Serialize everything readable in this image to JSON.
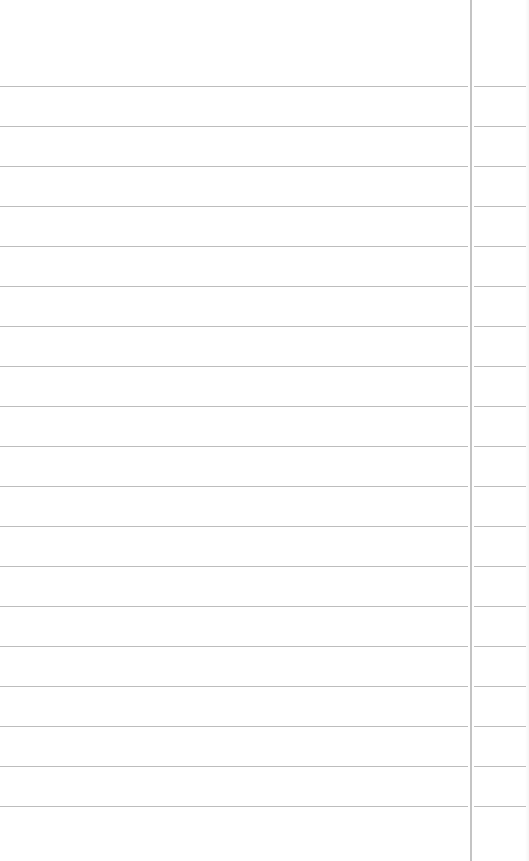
{
  "paper": {
    "type": "lined-notebook-page",
    "background_color": "#ffffff",
    "rule_color": "#bdbdbd",
    "margin_line_color": "#c4c4c4",
    "margin_line_x": 470,
    "rule_spacing_px": 40,
    "rule_positions_y": [
      86,
      126,
      166,
      206,
      246,
      286,
      326,
      366,
      406,
      446,
      486,
      526,
      566,
      606,
      646,
      686,
      726,
      766,
      806
    ],
    "text": ""
  }
}
